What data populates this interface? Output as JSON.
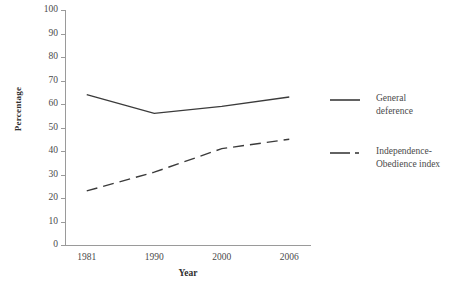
{
  "chart_data": {
    "type": "line",
    "title": "",
    "xlabel": "Year",
    "ylabel": "Percentage",
    "categories": [
      "1981",
      "1990",
      "2000",
      "2006"
    ],
    "ylim": [
      0,
      100
    ],
    "y_ticks": [
      "0",
      "10",
      "20",
      "30",
      "40",
      "50",
      "60",
      "70",
      "80",
      "90",
      "100"
    ],
    "grid": false,
    "legend_position": "right",
    "series": [
      {
        "name": "General deference",
        "label_line1": "General",
        "label_line2": "deference",
        "style": "solid",
        "color": "#3b3b3b",
        "values": [
          64,
          56,
          59,
          63
        ]
      },
      {
        "name": "Independence-Obedience index",
        "label_line1": "Independence-",
        "label_line2": "Obedience index",
        "style": "dashed",
        "color": "#3b3b3b",
        "values": [
          23,
          31,
          41,
          45
        ]
      }
    ]
  },
  "axes": {
    "y_title": "Percentage",
    "x_title": "Year",
    "axis_color": "#9a9a9a",
    "text_color": "#4a4a4a"
  }
}
